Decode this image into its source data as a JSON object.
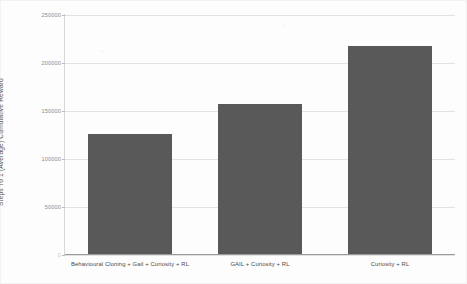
{
  "chart_data": {
    "type": "bar",
    "title": "",
    "xlabel": "",
    "ylabel": "Steps To 1 (Average) Cumulative Reward",
    "categories": [
      "Behavioural Cloning + Gail + Curiosity + RL",
      "GAIL + Curiosity + RL",
      "Curiosity + RL"
    ],
    "values": [
      126000,
      157000,
      218000
    ],
    "ylim": [
      0,
      250000
    ],
    "yticks": [
      0,
      50000,
      100000,
      150000,
      200000,
      250000
    ],
    "ytick_labels": [
      "0",
      "50000",
      "100000",
      "150000",
      "200000",
      "250000"
    ],
    "grid": true,
    "legend": false,
    "bar_color": "#595959",
    "gridline_color": "#e2e2e4",
    "axis_color": "#9a9a9c",
    "background_color": "#fdfdfd"
  }
}
